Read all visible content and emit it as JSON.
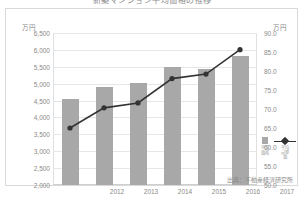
{
  "title": "新築マンション平均価格の推移",
  "axes": {
    "left_unit": "万円",
    "right_unit": "万円"
  },
  "source_note": "出典：不動産経済研究所",
  "legend": {
    "bar_label": "平均価格",
    "line_label": "平均㎡単価"
  },
  "chart_data": {
    "type": "bar",
    "title": "新築マンション平均価格の推移",
    "xlabel": "",
    "ylabel": "万円",
    "categories": [
      "2012",
      "2013",
      "2014",
      "2015",
      "2016",
      "2017"
    ],
    "grid": true,
    "legend_position": "right",
    "series": [
      {
        "name": "平均価格",
        "type": "bar",
        "axis": "left",
        "unit": "万円",
        "color": "#a8a8a8",
        "values": [
          4540,
          4900,
          5010,
          5480,
          5430,
          5820
        ]
      },
      {
        "name": "平均㎡単価",
        "type": "line",
        "axis": "right",
        "unit": "万円",
        "color": "#333333",
        "values": [
          65.0,
          70.3,
          71.6,
          78.0,
          79.2,
          85.6
        ]
      }
    ],
    "ylim": [
      2000,
      6500
    ],
    "yticks": [
      2000,
      2500,
      3000,
      3500,
      4000,
      4500,
      5000,
      5500,
      6000,
      6500
    ],
    "ytick_labels": [
      "2,000",
      "2,500",
      "3,000",
      "3,500",
      "4,000",
      "4,500",
      "5,000",
      "5,500",
      "6,000",
      "6,500"
    ],
    "y2lim": [
      50.0,
      90.0
    ],
    "y2ticks": [
      50.0,
      55.0,
      60.0,
      65.0,
      70.0,
      75.0,
      80.0,
      85.0,
      90.0
    ],
    "y2tick_labels": [
      "50.0",
      "55.0",
      "60.0",
      "65.0",
      "70.0",
      "75.0",
      "80.0",
      "85.0",
      "90.0"
    ]
  }
}
